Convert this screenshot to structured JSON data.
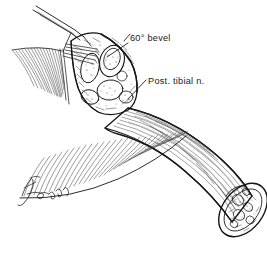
{
  "figure": {
    "style": "pen-and-ink medical line drawing",
    "background_color": "#ffffff",
    "ink_color": "#141414",
    "width": 267,
    "height": 267
  },
  "annotations": [
    {
      "id": "bevel-label",
      "text": "60° bevel",
      "x": 130,
      "y": 41,
      "leader": {
        "from_x": 128,
        "to_x": 107,
        "from_y": 43,
        "to_y": 57
      }
    },
    {
      "id": "nerve-label",
      "text": "Post. tibial n.",
      "x": 148,
      "y": 84,
      "leader": {
        "from_x": 146,
        "to_x": 128,
        "from_y": 86,
        "to_y": 99
      }
    }
  ],
  "signature": {
    "id": "artist-signature",
    "text": "",
    "x": 22,
    "y": 196,
    "description": "cursive artist signature, illegible"
  },
  "structures": [
    {
      "name": "retractor-instrument",
      "description": "four-tined surgical rake retractor entering from upper left"
    },
    {
      "name": "proximal-cross-section",
      "description": "beveled cut face showing stippled internal fascicular anatomy"
    },
    {
      "name": "graft-body",
      "description": "curved tubular limb with longitudinal striations"
    },
    {
      "name": "distal-cross-section",
      "description": "oval cut end at lower right showing internal anatomy"
    },
    {
      "name": "fascia-hatching-upper",
      "description": "fan of fine hatch lines at upper left representing reflected fascia"
    },
    {
      "name": "fascia-hatching-lower",
      "description": "fan of fine hatch lines at lower left representing tissue plane"
    }
  ]
}
